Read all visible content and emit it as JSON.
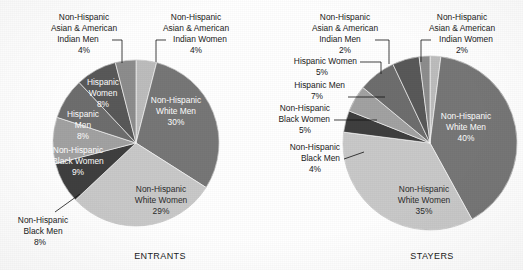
{
  "figure": {
    "background": "#ffffff",
    "text_color": "#1a1a1a",
    "label_color_on_dark": "#ffffff"
  },
  "palette": {
    "nh_white_men": "#777777",
    "nh_white_women": "#c9c9c9",
    "nh_black_men": "#3f3f3f",
    "nh_black_women": "#a2a2a2",
    "hispanic_men": "#6e6e6e",
    "hispanic_women": "#595959",
    "nh_asian_ai_men": "#8d8d8d",
    "nh_asian_ai_women": "#bdbdbd"
  },
  "chart_data": [
    {
      "type": "pie",
      "title": "ENTRANTS",
      "id": "entrants",
      "xlabel": "",
      "ylabel": "",
      "legend": "none",
      "units": "percent",
      "categories": [
        "Non-Hispanic Asian & American Indian Women",
        "Non-Hispanic White Men",
        "Non-Hispanic White Women",
        "Non-Hispanic Black Men",
        "Non-Hispanic Black Women",
        "Hispanic Men",
        "Hispanic Women",
        "Non-Hispanic Asian & American Indian Men"
      ],
      "values": [
        4,
        30,
        29,
        8,
        9,
        8,
        8,
        4
      ],
      "slices": [
        {
          "key": "nh_asian_ai_women",
          "label_lines": [
            "Non-Hispanic",
            "Asian & American",
            "Indian Women"
          ],
          "value_label": "4%",
          "color": "#bdbdbd",
          "label_placement": "outside"
        },
        {
          "key": "nh_white_men",
          "label_lines": [
            "Non-Hispanic",
            "White Men"
          ],
          "value_label": "30%",
          "color": "#777777",
          "label_placement": "inside"
        },
        {
          "key": "nh_white_women",
          "label_lines": [
            "Non-Hispanic",
            "White Women"
          ],
          "value_label": "29%",
          "color": "#c9c9c9",
          "label_placement": "inside"
        },
        {
          "key": "nh_black_men",
          "label_lines": [
            "Non-Hispanic",
            "Black Men"
          ],
          "value_label": "8%",
          "color": "#3f3f3f",
          "label_placement": "outside"
        },
        {
          "key": "nh_black_women",
          "label_lines": [
            "Non-Hispanic",
            "Black Women"
          ],
          "value_label": "9%",
          "color": "#a2a2a2",
          "label_placement": "inside"
        },
        {
          "key": "hispanic_men",
          "label_lines": [
            "Hispanic",
            "Men"
          ],
          "value_label": "8%",
          "color": "#6e6e6e",
          "label_placement": "inside"
        },
        {
          "key": "hispanic_women",
          "label_lines": [
            "Hispanic",
            "Women"
          ],
          "value_label": "8%",
          "color": "#595959",
          "label_placement": "inside"
        },
        {
          "key": "nh_asian_ai_men",
          "label_lines": [
            "Non-Hispanic",
            "Asian & American",
            "Indian Men"
          ],
          "value_label": "4%",
          "color": "#8d8d8d",
          "label_placement": "outside"
        }
      ]
    },
    {
      "type": "pie",
      "title": "STAYERS",
      "id": "stayers",
      "xlabel": "",
      "ylabel": "",
      "legend": "none",
      "units": "percent",
      "categories": [
        "Non-Hispanic Asian & American Indian Women",
        "Non-Hispanic White Men",
        "Non-Hispanic White Women",
        "Non-Hispanic Black Men",
        "Non-Hispanic Black Women",
        "Hispanic Men",
        "Hispanic Women",
        "Non-Hispanic Asian & American Indian Men"
      ],
      "values": [
        2,
        40,
        35,
        4,
        5,
        7,
        5,
        2
      ],
      "slices": [
        {
          "key": "nh_asian_ai_women",
          "label_lines": [
            "Non-Hispanic",
            "Asian & American",
            "Indian Women"
          ],
          "value_label": "2%",
          "color": "#bdbdbd",
          "label_placement": "outside"
        },
        {
          "key": "nh_white_men",
          "label_lines": [
            "Non-Hispanic",
            "White Men"
          ],
          "value_label": "40%",
          "color": "#777777",
          "label_placement": "inside"
        },
        {
          "key": "nh_white_women",
          "label_lines": [
            "Non-Hispanic",
            "White Women"
          ],
          "value_label": "35%",
          "color": "#c9c9c9",
          "label_placement": "inside"
        },
        {
          "key": "nh_black_men",
          "label_lines": [
            "Non-Hispanic",
            "Black Men"
          ],
          "value_label": "4%",
          "color": "#3f3f3f",
          "label_placement": "outside"
        },
        {
          "key": "nh_black_women",
          "label_lines": [
            "Non-Hispanic",
            "Black Women"
          ],
          "value_label": "5%",
          "color": "#a2a2a2",
          "label_placement": "outside"
        },
        {
          "key": "hispanic_men",
          "label_lines": [
            "Hispanic Men"
          ],
          "value_label": "7%",
          "color": "#6e6e6e",
          "label_placement": "outside"
        },
        {
          "key": "hispanic_women",
          "label_lines": [
            "Hispanic Women"
          ],
          "value_label": "5%",
          "color": "#595959",
          "label_placement": "outside"
        },
        {
          "key": "nh_asian_ai_men",
          "label_lines": [
            "Non-Hispanic",
            "Asian & American",
            "Indian Men"
          ],
          "value_label": "2%",
          "color": "#8d8d8d",
          "label_placement": "outside"
        }
      ]
    }
  ],
  "labels": {
    "entrants": {
      "caption": "ENTRANTS",
      "asian_men": {
        "l1": "Non-Hispanic",
        "l2": "Asian & American",
        "l3": "Indian Men",
        "pct": "4%"
      },
      "asian_women": {
        "l1": "Non-Hispanic",
        "l2": "Asian & American",
        "l3": "Indian Women",
        "pct": "4%"
      },
      "white_men": {
        "l1": "Non-Hispanic",
        "l2": "White Men",
        "pct": "30%"
      },
      "white_women": {
        "l1": "Non-Hispanic",
        "l2": "White Women",
        "pct": "29%"
      },
      "black_men": {
        "l1": "Non-Hispanic",
        "l2": "Black Men",
        "pct": "8%"
      },
      "black_women": {
        "l1": "Non-Hispanic",
        "l2": "Black Women",
        "pct": "9%"
      },
      "hisp_men": {
        "l1": "Hispanic",
        "l2": "Men",
        "pct": "8%"
      },
      "hisp_women": {
        "l1": "Hispanic",
        "l2": "Women",
        "pct": "8%"
      }
    },
    "stayers": {
      "caption": "STAYERS",
      "asian_men": {
        "l1": "Non-Hispanic",
        "l2": "Asian & American",
        "l3": "Indian Men",
        "pct": "2%"
      },
      "asian_women": {
        "l1": "Non-Hispanic",
        "l2": "Asian & American",
        "l3": "Indian Women",
        "pct": "2%"
      },
      "white_men": {
        "l1": "Non-Hispanic",
        "l2": "White Men",
        "pct": "40%"
      },
      "white_women": {
        "l1": "Non-Hispanic",
        "l2": "White Women",
        "pct": "35%"
      },
      "black_men": {
        "l1": "Non-Hispanic",
        "l2": "Black Men",
        "pct": "4%"
      },
      "black_women": {
        "l1": "Non-Hispanic",
        "l2": "Black Women",
        "pct": "5%"
      },
      "hisp_men": {
        "l1": "Hispanic Men",
        "pct": "7%"
      },
      "hisp_women": {
        "l1": "Hispanic Women",
        "pct": "5%"
      }
    }
  }
}
